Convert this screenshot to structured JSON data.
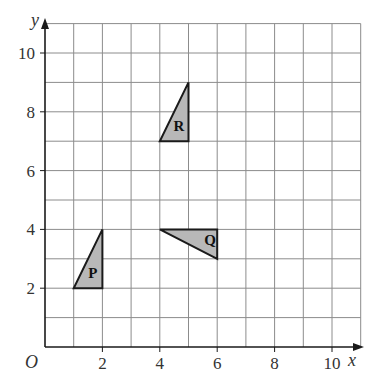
{
  "diagram": {
    "type": "coordinate-grid",
    "x_axis": {
      "label": "x",
      "min": 0,
      "max": 11,
      "ticks": [
        "2",
        "4",
        "6",
        "8",
        "10"
      ]
    },
    "y_axis": {
      "label": "y",
      "min": 0,
      "max": 11,
      "ticks": [
        "2",
        "4",
        "6",
        "8",
        "10"
      ]
    },
    "origin_label": "O",
    "shapes": [
      {
        "label": "P",
        "vertices": [
          [
            1,
            2
          ],
          [
            2,
            2
          ],
          [
            2,
            4
          ]
        ],
        "fill": "#b8b8b8"
      },
      {
        "label": "Q",
        "vertices": [
          [
            4,
            4
          ],
          [
            6,
            4
          ],
          [
            6,
            3
          ]
        ],
        "fill": "#b8b8b8"
      },
      {
        "label": "R",
        "vertices": [
          [
            4,
            7
          ],
          [
            5,
            7
          ],
          [
            5,
            9
          ]
        ],
        "fill": "#b8b8b8"
      }
    ]
  }
}
